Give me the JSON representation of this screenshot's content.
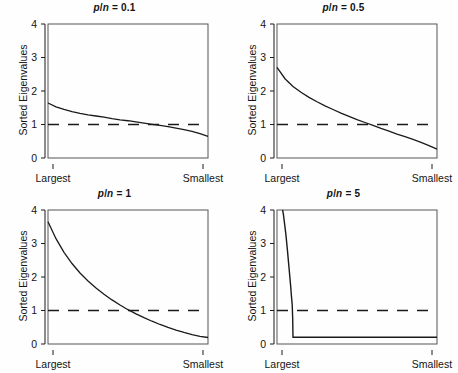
{
  "figure": {
    "background_color": "#fefefe",
    "line_color": "#1a1a1a",
    "panel_layout": "2x2"
  },
  "axis": {
    "ylabel": "Sorted Eigenvalues",
    "y_ticks": [
      "0",
      "1",
      "2",
      "3",
      "4"
    ],
    "y_tick_values": [
      0,
      1,
      2,
      3,
      4
    ],
    "x_left_label": "Largest",
    "x_right_label": "Smallest",
    "ylim": [
      -0.18,
      4.35
    ],
    "grid": "off",
    "legend": "none"
  },
  "panels": [
    {
      "id": "panel-p-n-0-1",
      "title_prefix": "p",
      "title_sep": "/",
      "title_mid": "n",
      "title_suffix": " = 0.1",
      "title_text": "p/n = 0.1",
      "ratio": 0.1
    },
    {
      "id": "panel-p-n-0-5",
      "title_prefix": "p",
      "title_sep": "/",
      "title_mid": "n",
      "title_suffix": " = 0.5",
      "title_text": "p/n = 0.5",
      "ratio": 0.5
    },
    {
      "id": "panel-p-n-1",
      "title_prefix": "p",
      "title_sep": "/",
      "title_mid": "n",
      "title_suffix": " = 1",
      "title_text": "p/n = 1",
      "ratio": 1
    },
    {
      "id": "panel-p-n-5",
      "title_prefix": "p",
      "title_sep": "/",
      "title_mid": "n",
      "title_suffix": " = 5",
      "title_text": "p/n = 5",
      "ratio": 5
    }
  ],
  "chart_data": {
    "type": "line",
    "xlabel": "",
    "ylabel": "Sorted Eigenvalues",
    "x_tick_labels": [
      "Largest",
      "Smallest"
    ],
    "y_tick_labels": [
      "0",
      "1",
      "2",
      "3",
      "4"
    ],
    "ylim": [
      -0.18,
      4.35
    ],
    "xlim": [
      0,
      1
    ],
    "grid": false,
    "legend_position": "none",
    "reference_line": {
      "value": 1,
      "style": "dashed",
      "label": "eigenvalue = 1"
    },
    "panels": [
      {
        "title": "p/n = 0.1",
        "ratio": 0.1,
        "x": [
          0.0,
          0.05,
          0.1,
          0.15,
          0.2,
          0.25,
          0.3,
          0.35,
          0.4,
          0.45,
          0.5,
          0.55,
          0.6,
          0.65,
          0.7,
          0.75,
          0.8,
          0.85,
          0.9,
          0.95,
          1.0
        ],
        "y": [
          1.68,
          1.55,
          1.46,
          1.39,
          1.33,
          1.28,
          1.24,
          1.2,
          1.15,
          1.11,
          1.08,
          1.04,
          1.0,
          0.96,
          0.92,
          0.88,
          0.83,
          0.78,
          0.72,
          0.64,
          0.55
        ],
        "crossing_x": 0.6
      },
      {
        "title": "p/n = 0.5",
        "ratio": 0.5,
        "x": [
          0.0,
          0.05,
          0.1,
          0.15,
          0.2,
          0.25,
          0.3,
          0.35,
          0.4,
          0.45,
          0.5,
          0.55,
          0.6,
          0.65,
          0.7,
          0.75,
          0.8,
          0.85,
          0.9,
          0.95,
          1.0
        ],
        "y": [
          2.88,
          2.5,
          2.24,
          2.04,
          1.87,
          1.72,
          1.58,
          1.46,
          1.34,
          1.23,
          1.12,
          1.02,
          0.92,
          0.82,
          0.73,
          0.63,
          0.54,
          0.45,
          0.35,
          0.24,
          0.12
        ],
        "crossing_x": 0.55
      },
      {
        "title": "p/n = 1",
        "ratio": 1,
        "x": [
          0.0,
          0.05,
          0.1,
          0.15,
          0.2,
          0.25,
          0.3,
          0.35,
          0.4,
          0.45,
          0.5,
          0.55,
          0.6,
          0.65,
          0.7,
          0.75,
          0.8,
          0.85,
          0.9,
          0.95,
          1.0
        ],
        "y": [
          3.95,
          3.38,
          2.92,
          2.54,
          2.22,
          1.95,
          1.71,
          1.5,
          1.31,
          1.14,
          0.98,
          0.84,
          0.71,
          0.59,
          0.48,
          0.38,
          0.29,
          0.21,
          0.14,
          0.08,
          0.04
        ],
        "crossing_x": 0.49
      },
      {
        "title": "p/n = 5",
        "ratio": 5,
        "x": [
          0.0,
          0.02,
          0.04,
          0.055,
          0.065,
          0.075,
          0.085,
          0.09,
          0.095,
          0.098,
          0.1,
          0.12,
          0.2,
          0.4,
          0.6,
          0.8,
          1.0
        ],
        "y": [
          5.3,
          4.8,
          4.2,
          3.55,
          3.0,
          2.4,
          1.8,
          1.45,
          1.15,
          0.7,
          0.05,
          0.05,
          0.05,
          0.05,
          0.05,
          0.05,
          0.05
        ],
        "crossing_x": 0.096,
        "note": "curve exits top of panel above y=4.2"
      }
    ]
  }
}
